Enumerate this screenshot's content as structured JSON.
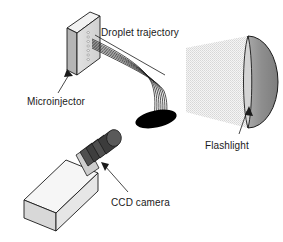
{
  "figure": {
    "background_color": "#ffffff"
  },
  "labels": {
    "droplet_trajectory": "Droplet trajectory",
    "microinjector": "Microinjector",
    "flashlight": "Flashlight",
    "ccd_camera": "CCD camera"
  },
  "components": [
    {
      "name": "microinjector",
      "label": "Microinjector",
      "shape": "3d-plate",
      "description": "Vertical rectangular slab shown in oblique projection with a column of small orifices on its front face",
      "colors": {
        "face": "#d9d9d9",
        "top": "#f0f0f0",
        "side": "#9e9e9e",
        "outline": "#1a1a1a"
      }
    },
    {
      "name": "droplet-trajectory",
      "label": "Droplet trajectory",
      "shape": "curved-streamlines",
      "description": "Bundle of thin curving lines leaving the microinjector orifices and falling into a dark elliptical pool",
      "stream_count": 7,
      "colors": {
        "lines": "#1a1a1a",
        "pool": "#000000"
      }
    },
    {
      "name": "flashlight",
      "label": "Flashlight",
      "shape": "half-dome-with-cone",
      "description": "Semicircular dome emitting a dithered trapezoidal light cone toward the left",
      "colors": {
        "dome": "#8c8c8c",
        "rim": "#d0d0d0",
        "cone": "#e6e6e6",
        "outline": "#1a1a1a"
      }
    },
    {
      "name": "ccd-camera",
      "label": "CCD camera",
      "shape": "3d-box-with-lens",
      "description": "Light gray rectangular body in oblique projection with a dark ribbed cylindrical lens at its upper right end",
      "lens_ribs": 4,
      "colors": {
        "body": "#ededed",
        "body_side": "#cfcfcf",
        "lens": "#4a4a4a",
        "lens_dark": "#3a3a3a",
        "outline": "#1a1a1a"
      }
    }
  ],
  "leader_lines": [
    {
      "name": "microinjector-leader",
      "from": "Microinjector",
      "to": "microinjector",
      "arrow": "triangle",
      "direction": "up-left"
    },
    {
      "name": "flashlight-leader",
      "from": "Flashlight",
      "to": "flashlight",
      "arrow": "triangle",
      "direction": "up-right"
    },
    {
      "name": "ccd-camera-leader",
      "from": "CCD camera",
      "to": "ccd-camera-lens",
      "arrow": "triangle",
      "direction": "up-left"
    },
    {
      "name": "droplet-trajectory-leader",
      "from": "Droplet trajectory",
      "to": "droplet-trajectory",
      "arrow": "none",
      "direction": "down-right"
    }
  ]
}
